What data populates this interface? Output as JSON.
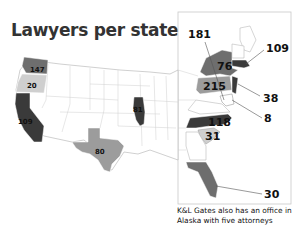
{
  "title": "Lawyers per state",
  "footnote": "K&L Gates also has an office in Alaska with five attorneys",
  "colors": {
    "darkest": "#3a3a3a",
    "dark": "#6e6e6e",
    "medium": "#9c9c9c",
    "light": "#cfcfcf",
    "border": "#bbbbbb"
  },
  "states": [
    {
      "state": "Washington",
      "value": "147"
    },
    {
      "state": "Oregon",
      "value": "20"
    },
    {
      "state": "California",
      "value": "109"
    },
    {
      "state": "Texas",
      "value": "80"
    },
    {
      "state": "Illinois",
      "value": "81"
    },
    {
      "state": "New York",
      "value": "76"
    },
    {
      "state": "Pennsylvania",
      "value": "215"
    },
    {
      "state": "Washington DC / Maryland area",
      "value": "181"
    },
    {
      "state": "Massachusetts",
      "value": "109"
    },
    {
      "state": "New Jersey",
      "value": "38"
    },
    {
      "state": "Delaware",
      "value": "8"
    },
    {
      "state": "North Carolina",
      "value": "118"
    },
    {
      "state": "South Carolina",
      "value": "31"
    },
    {
      "state": "Florida",
      "value": "30"
    }
  ]
}
